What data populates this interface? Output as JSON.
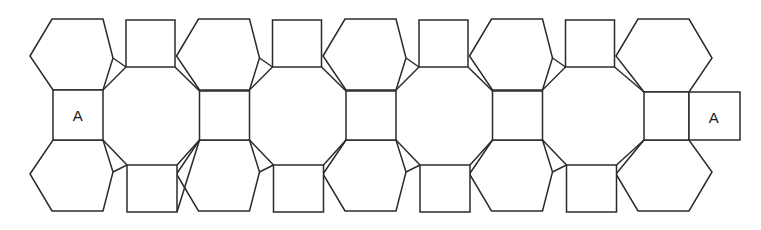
{
  "figure": {
    "name": "polyhedron-net",
    "background_color": "#ffffff",
    "stroke_color": "#2b2b2b",
    "stroke_width": 1.5,
    "width": 761,
    "height": 230
  },
  "labels": [
    {
      "text": "A",
      "x": 78,
      "y": 115,
      "name": "glue-label-a-left"
    },
    {
      "text": "A",
      "x": 714,
      "y": 117,
      "name": "glue-label-a-right"
    }
  ],
  "geometry": {
    "column_pitch": 146.5,
    "hex_columns_x": [
      30,
      176.5,
      323,
      469.5,
      616
    ],
    "top_hexagons": [
      {
        "points": "30,56 52,19 103,19 113,58 103,90 53,90"
      },
      {
        "points": "176.5,56 198.5,19 249.5,19 259.5,58 249.5,90 199.5,90"
      },
      {
        "points": "323,56 345,19 396,19 406,58 396,90 346,90"
      },
      {
        "points": "469.5,56 491.5,19 542.5,19 552.5,58 542.5,90 492.5,90"
      },
      {
        "points": "616,56 638,19 689,19 712,58 689,92 644,92"
      }
    ],
    "bottom_hexagons": [
      {
        "points": "30,174 53,140 103,140 113,172 103,211 52,211"
      },
      {
        "points": "176.5,174 199.5,140 249.5,140 259.5,172 249.5,211 198.5,211"
      },
      {
        "points": "323,174 346,140 396,140 406,172 396,211 345,211"
      },
      {
        "points": "469.5,174 492.5,140 542.5,140 552.5,172 542.5,211 491.5,211"
      },
      {
        "points": "616,174 644,140 689,140 712,172 689,211 638,211"
      }
    ],
    "middle_squares": [
      {
        "points": "53,90 103,90 103,140 53,140",
        "label": "A"
      },
      {
        "points": "199.5,91 249.5,91 249.5,140 199.5,140",
        "label": ""
      },
      {
        "points": "346,91 396,91 396,140 346,140",
        "label": ""
      },
      {
        "points": "492.5,91 542.5,91 542.5,140 492.5,140",
        "label": ""
      },
      {
        "points": "644,92 689,92 689,140 644,140",
        "label": ""
      },
      {
        "points": "689,92 740,92 740,140 689,140",
        "label": "A"
      }
    ],
    "top_squares": [
      {
        "points": "126,20 175,20 175,67 126,67"
      },
      {
        "points": "272.5,20 321.5,20 321.5,67 272.5,67"
      },
      {
        "points": "419,20 468,20 468,67 419,67"
      },
      {
        "points": "565.5,20 614.5,20 614.5,67 565.5,67"
      }
    ],
    "bottom_squares": [
      {
        "points": "127,165 177,165 177,212 127,212"
      },
      {
        "points": "273.5,165 323.5,165 323.5,212 273.5,212"
      },
      {
        "points": "420,165 470,165 470,212 420,212"
      },
      {
        "points": "566.5,165 616.5,165 616.5,212 566.5,212"
      }
    ],
    "connector_edges": [
      "M103,90 L126,67",
      "M175,67 L199.5,91",
      "M103,140 L127,165",
      "M177,212 L199.5,140",
      "M177,165 L199.5,140",
      "M249.5,90 L272.5,67",
      "M321.5,67 L346,91",
      "M249.5,140 L273.5,165",
      "M323.5,165 L346,140",
      "M396,90 L419,67",
      "M468,67 L492.5,91",
      "M396,140 L420,165",
      "M470,165 L492.5,140",
      "M542.5,90 L565.5,67",
      "M614.5,67 L644,92",
      "M542.5,140 L566.5,165",
      "M616.5,165 L644,140",
      "M126,67 L113,58",
      "M113,172 L127,165",
      "M272.5,67 L259.5,58",
      "M259.5,172 L273.5,165",
      "M419,67 L406,58",
      "M406,172 L420,165",
      "M565.5,67 L552.5,58",
      "M552.5,172 L566.5,165"
    ]
  }
}
